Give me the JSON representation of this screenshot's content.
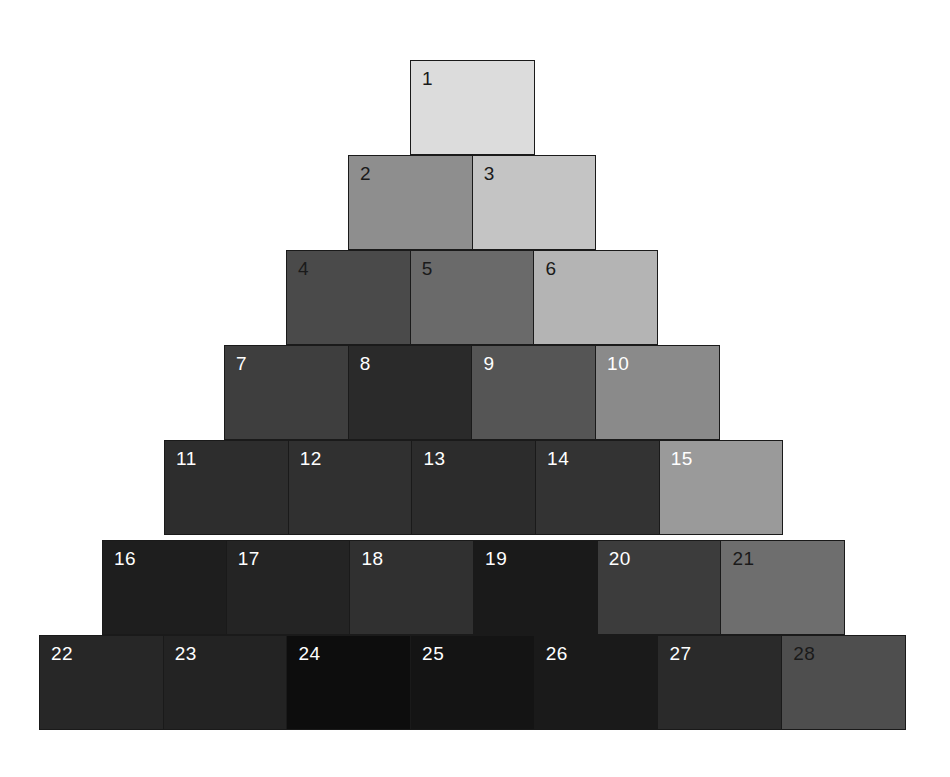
{
  "figure": {
    "type": "grayscale-tile-pyramid",
    "background_color": "#ffffff",
    "tile_border_color": "#1a1a1a",
    "total_tiles": 28,
    "row_count": 7,
    "tile_width_px": 124.7,
    "tile_height_px": 95,
    "row_left_step_px": 62,
    "canvas_width_px": 950,
    "canvas_height_px": 777
  },
  "chart_data": {
    "type": "heatmap",
    "title": "",
    "subtitle": "",
    "xlabel": "",
    "ylabel": "",
    "legend": [],
    "grid": false,
    "layout": "centered pyramid, row n contains n tiles, rows shift left by half a tile",
    "value_units": "grayscale luminance (0 = black, 255 = white)",
    "categories": [
      "1",
      "2",
      "3",
      "4",
      "5",
      "6",
      "7",
      "8",
      "9",
      "10",
      "11",
      "12",
      "13",
      "14",
      "15",
      "16",
      "17",
      "18",
      "19",
      "20",
      "21",
      "22",
      "23",
      "24",
      "25",
      "26",
      "27",
      "28"
    ],
    "values": [
      220,
      142,
      196,
      74,
      106,
      180,
      62,
      42,
      85,
      138,
      45,
      48,
      44,
      51,
      154,
      30,
      36,
      48,
      26,
      60,
      110,
      39,
      35,
      13,
      20,
      26,
      42,
      78
    ],
    "rows": [
      {
        "index": 1,
        "left_px": 410,
        "top_px": 60,
        "tiles": [
          {
            "label": "1",
            "color": "#dcdcdc",
            "value": 220,
            "text_color": "dark"
          }
        ]
      },
      {
        "index": 2,
        "left_px": 348,
        "top_px": 155,
        "tiles": [
          {
            "label": "2",
            "color": "#8e8e8e",
            "value": 142,
            "text_color": "dark"
          },
          {
            "label": "3",
            "color": "#c4c4c4",
            "value": 196,
            "text_color": "dark"
          }
        ]
      },
      {
        "index": 3,
        "left_px": 286,
        "top_px": 250,
        "tiles": [
          {
            "label": "4",
            "color": "#4a4a4a",
            "value": 74,
            "text_color": "dark"
          },
          {
            "label": "5",
            "color": "#6a6a6a",
            "value": 106,
            "text_color": "dark"
          },
          {
            "label": "6",
            "color": "#b4b4b4",
            "value": 180,
            "text_color": "dark"
          }
        ]
      },
      {
        "index": 4,
        "left_px": 224,
        "top_px": 345,
        "tiles": [
          {
            "label": "7",
            "color": "#3e3e3e",
            "value": 62,
            "text_color": "light"
          },
          {
            "label": "8",
            "color": "#2a2a2a",
            "value": 42,
            "text_color": "light"
          },
          {
            "label": "9",
            "color": "#555555",
            "value": 85,
            "text_color": "light"
          },
          {
            "label": "10",
            "color": "#8a8a8a",
            "value": 138,
            "text_color": "light"
          }
        ]
      },
      {
        "index": 5,
        "left_px": 164,
        "top_px": 440,
        "tiles": [
          {
            "label": "11",
            "color": "#2d2d2d",
            "value": 45,
            "text_color": "light"
          },
          {
            "label": "12",
            "color": "#303030",
            "value": 48,
            "text_color": "light"
          },
          {
            "label": "13",
            "color": "#2c2c2c",
            "value": 44,
            "text_color": "light"
          },
          {
            "label": "14",
            "color": "#333333",
            "value": 51,
            "text_color": "light"
          },
          {
            "label": "15",
            "color": "#9a9a9a",
            "value": 154,
            "text_color": "light"
          }
        ]
      },
      {
        "index": 6,
        "left_px": 102,
        "top_px": 540,
        "tiles": [
          {
            "label": "16",
            "color": "#1e1e1e",
            "value": 30,
            "text_color": "light"
          },
          {
            "label": "17",
            "color": "#242424",
            "value": 36,
            "text_color": "light"
          },
          {
            "label": "18",
            "color": "#303030",
            "value": 48,
            "text_color": "light"
          },
          {
            "label": "19",
            "color": "#1a1a1a",
            "value": 26,
            "text_color": "light"
          },
          {
            "label": "20",
            "color": "#3c3c3c",
            "value": 60,
            "text_color": "light"
          },
          {
            "label": "21",
            "color": "#6e6e6e",
            "value": 110,
            "text_color": "dark"
          }
        ]
      },
      {
        "index": 7,
        "left_px": 39,
        "top_px": 635,
        "tiles": [
          {
            "label": "22",
            "color": "#272727",
            "value": 39,
            "text_color": "light"
          },
          {
            "label": "23",
            "color": "#232323",
            "value": 35,
            "text_color": "light"
          },
          {
            "label": "24",
            "color": "#0d0d0d",
            "value": 13,
            "text_color": "light"
          },
          {
            "label": "25",
            "color": "#141414",
            "value": 20,
            "text_color": "light"
          },
          {
            "label": "26",
            "color": "#1a1a1a",
            "value": 26,
            "text_color": "light"
          },
          {
            "label": "27",
            "color": "#2a2a2a",
            "value": 42,
            "text_color": "light"
          },
          {
            "label": "28",
            "color": "#4e4e4e",
            "value": 78,
            "text_color": "dark"
          }
        ]
      }
    ]
  }
}
